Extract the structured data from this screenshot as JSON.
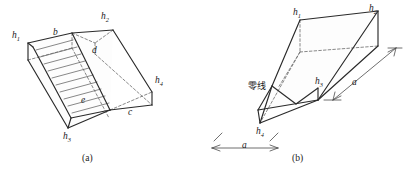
{
  "figure": {
    "background_color": "#ffffff",
    "line_color": "#2a2a2a",
    "dashed_color": "#6a6a6a",
    "hatch_color": "#555555",
    "panels": [
      {
        "id": "a",
        "caption": "(a)",
        "labels": [
          {
            "name": "h1",
            "base": "h",
            "sub": "1",
            "x": 12,
            "y": 36
          },
          {
            "name": "h2",
            "base": "h",
            "sub": "2",
            "x": 101,
            "y": 15
          },
          {
            "name": "h3",
            "base": "h",
            "sub": "3",
            "x": 63,
            "y": 136
          },
          {
            "name": "h4",
            "base": "h",
            "sub": "4",
            "x": 155,
            "y": 80
          },
          {
            "name": "b",
            "base": "b",
            "sub": "",
            "x": 53,
            "y": 33
          },
          {
            "name": "d",
            "base": "d",
            "sub": "",
            "x": 92,
            "y": 50
          },
          {
            "name": "e",
            "base": "e",
            "sub": "",
            "x": 81,
            "y": 101
          },
          {
            "name": "c",
            "base": "c",
            "sub": "",
            "x": 128,
            "y": 112
          }
        ]
      },
      {
        "id": "b",
        "caption": "(b)",
        "labels": [
          {
            "name": "h1",
            "base": "h",
            "sub": "1",
            "x": 93,
            "y": 11,
            "panel": "b"
          },
          {
            "name": "h2",
            "base": "h",
            "sub": "2",
            "x": 169,
            "y": 7,
            "panel": "b"
          },
          {
            "name": "h3",
            "base": "h",
            "sub": "3",
            "x": 115,
            "y": 80,
            "panel": "b"
          },
          {
            "name": "h4",
            "base": "h",
            "sub": "4",
            "x": 56,
            "y": 130,
            "panel": "b"
          },
          {
            "name": "a-left",
            "base": "a",
            "sub": "",
            "x": 46,
            "y": 146,
            "panel": "b"
          },
          {
            "name": "a-right",
            "base": "a",
            "sub": "",
            "x": 152,
            "y": 80,
            "panel": "b"
          }
        ],
        "annotation": {
          "name": "zero-line",
          "text": "零线",
          "x": 48,
          "y": 84
        }
      }
    ]
  }
}
